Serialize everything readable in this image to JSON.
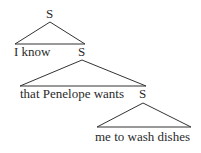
{
  "diagram": {
    "type": "syntax-tree",
    "line_color": "#333333",
    "nodes": [
      {
        "id": "s1",
        "label": "S",
        "x": 50,
        "y": 7
      },
      {
        "id": "s1-left",
        "label": "I know",
        "x": 14,
        "y": 45
      },
      {
        "id": "s2",
        "label": "S",
        "x": 82,
        "y": 45
      },
      {
        "id": "s2-left",
        "label": "that Penelope wants",
        "x": 20,
        "y": 87
      },
      {
        "id": "s3",
        "label": "S",
        "x": 143,
        "y": 87
      },
      {
        "id": "s3-child",
        "label": "me to wash dishes",
        "x": 95,
        "y": 130
      }
    ],
    "triangles": [
      {
        "apex": [
          50,
          22
        ],
        "left": [
          15,
          44
        ],
        "right": [
          85,
          44
        ]
      },
      {
        "apex": [
          82,
          60
        ],
        "left": [
          20,
          86
        ],
        "right": [
          146,
          86
        ]
      },
      {
        "apex": [
          143,
          103
        ],
        "left": [
          97,
          127
        ],
        "right": [
          191,
          127
        ]
      }
    ]
  }
}
